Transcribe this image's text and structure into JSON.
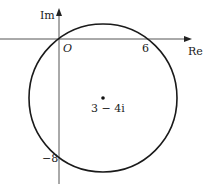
{
  "diagram": {
    "type": "complex-plane-circle",
    "axes": {
      "x_label": "Re",
      "y_label": "Im",
      "origin_label": "O"
    },
    "ticks": {
      "x_intercept_label": "6",
      "y_intercept_label": "−8"
    },
    "circle": {
      "center_label": "3 − 4i",
      "center": [
        3,
        -4
      ],
      "radius": 5
    },
    "colors": {
      "stroke": "#1a1a1a",
      "axis": "#555555"
    }
  }
}
